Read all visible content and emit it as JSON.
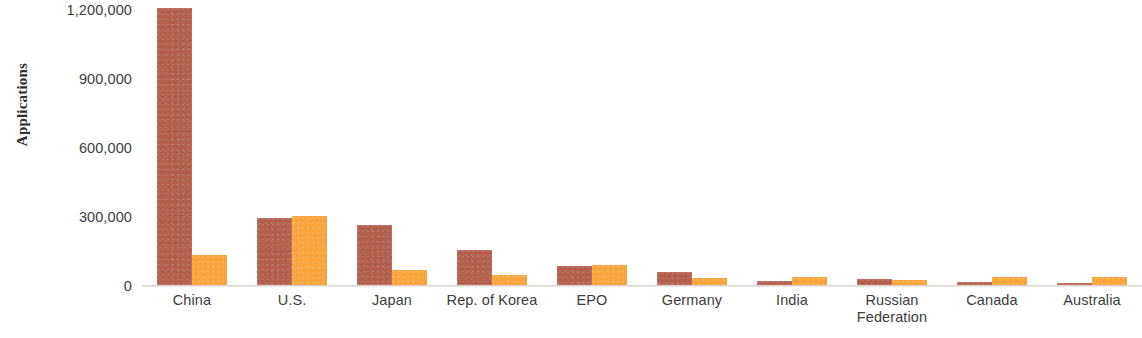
{
  "chart_data": {
    "type": "bar",
    "title": "",
    "subtitle": "",
    "xlabel": "",
    "ylabel": "Applications",
    "ylim": [
      0,
      1200000
    ],
    "yticks": [
      0,
      300000,
      600000,
      900000,
      1200000
    ],
    "ytick_labels": [
      "0",
      "300,000",
      "600,000",
      "900,000",
      "1,200,000"
    ],
    "grid": false,
    "legend": "none",
    "categories": [
      "China",
      "U.S.",
      "Japan",
      "Rep. of Korea",
      "EPO",
      "Germany",
      "India",
      "Russian Federation",
      "Canada",
      "Australia"
    ],
    "category_lines": [
      [
        "China"
      ],
      [
        "U.S."
      ],
      [
        "Japan"
      ],
      [
        "Rep. of Korea"
      ],
      [
        "EPO"
      ],
      [
        "Germany"
      ],
      [
        "India"
      ],
      [
        "Russian",
        "Federation"
      ],
      [
        "Canada"
      ],
      [
        "Australia"
      ]
    ],
    "series": [
      {
        "name": "series-1",
        "color": "#b3604e",
        "values": [
          1205000,
          292000,
          260000,
          152000,
          82000,
          57000,
          18000,
          26000,
          12000,
          8000
        ]
      },
      {
        "name": "series-2",
        "color": "#faa63e",
        "values": [
          131000,
          302000,
          65000,
          44000,
          85000,
          29000,
          34000,
          23000,
          33000,
          34000
        ]
      }
    ]
  },
  "colors": {
    "series_1": "#b3604e",
    "series_2": "#faa63e",
    "text": "#3d3d3d",
    "axis_line": "#d9d4cf",
    "background": "#ffffff"
  }
}
